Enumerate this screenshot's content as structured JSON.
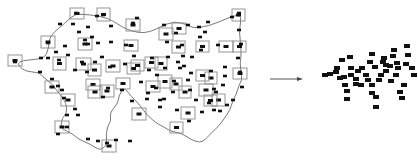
{
  "diagram": {
    "width": 418,
    "height": 163,
    "colors": {
      "box_stroke": "#8a8a8a",
      "dot_fill": "#111111",
      "curve_stroke": "#555555",
      "background": "#ffffff"
    },
    "curve_path": [
      [
        77,
        14
      ],
      [
        104,
        15
      ],
      [
        123,
        28
      ],
      [
        138,
        33
      ],
      [
        150,
        32
      ],
      [
        160,
        27
      ],
      [
        174,
        21
      ],
      [
        188,
        25
      ],
      [
        193,
        28
      ],
      [
        203,
        27
      ],
      [
        214,
        24
      ],
      [
        240,
        13
      ],
      [
        241,
        22
      ],
      [
        239,
        31
      ],
      [
        241,
        45
      ],
      [
        241,
        58
      ],
      [
        240,
        63
      ],
      [
        241,
        71
      ],
      [
        242,
        80
      ],
      [
        239,
        85
      ],
      [
        236,
        95
      ],
      [
        233,
        100
      ],
      [
        230,
        110
      ],
      [
        224,
        119
      ],
      [
        218,
        127
      ],
      [
        212,
        132
      ],
      [
        206,
        139
      ],
      [
        200,
        143
      ],
      [
        190,
        139
      ],
      [
        186,
        136
      ],
      [
        180,
        133
      ],
      [
        170,
        131
      ],
      [
        164,
        127
      ],
      [
        158,
        124
      ],
      [
        150,
        118
      ],
      [
        144,
        111
      ],
      [
        138,
        103
      ],
      [
        131,
        96
      ],
      [
        127,
        91
      ],
      [
        124,
        88
      ],
      [
        119,
        95
      ],
      [
        118,
        103
      ],
      [
        112,
        110
      ],
      [
        110,
        115
      ],
      [
        111,
        121
      ],
      [
        108,
        125
      ],
      [
        106,
        135
      ],
      [
        107,
        143
      ],
      [
        104,
        148
      ],
      [
        99,
        150
      ],
      [
        90,
        144
      ],
      [
        78,
        139
      ],
      [
        73,
        134
      ],
      [
        62,
        129
      ],
      [
        61,
        126
      ],
      [
        62,
        118
      ],
      [
        67,
        113
      ],
      [
        66,
        103
      ],
      [
        62,
        97
      ],
      [
        58,
        92
      ],
      [
        55,
        88
      ],
      [
        52,
        84
      ],
      [
        42,
        76
      ],
      [
        40,
        73
      ],
      [
        32,
        72
      ],
      [
        22,
        70
      ],
      [
        16,
        61
      ],
      [
        42,
        59
      ],
      [
        47,
        54
      ],
      [
        49,
        44
      ],
      [
        50,
        36
      ],
      [
        60,
        27
      ],
      [
        64,
        24
      ],
      [
        70,
        18
      ],
      [
        77,
        14
      ]
    ],
    "curve_boxes": [
      {
        "x": 70,
        "y": 8,
        "w": 14,
        "h": 11
      },
      {
        "x": 97,
        "y": 8,
        "w": 13,
        "h": 13
      },
      {
        "x": 126,
        "y": 19,
        "w": 14,
        "h": 12
      },
      {
        "x": 41,
        "y": 36,
        "w": 14,
        "h": 12
      },
      {
        "x": 8,
        "y": 55,
        "w": 14,
        "h": 11
      },
      {
        "x": 45,
        "y": 81,
        "w": 14,
        "h": 12
      },
      {
        "x": 61,
        "y": 94,
        "w": 14,
        "h": 12
      },
      {
        "x": 55,
        "y": 121,
        "w": 14,
        "h": 12
      },
      {
        "x": 102,
        "y": 140,
        "w": 14,
        "h": 12
      },
      {
        "x": 172,
        "y": 23,
        "w": 14,
        "h": 11
      },
      {
        "x": 159,
        "y": 28,
        "w": 14,
        "h": 12
      },
      {
        "x": 232,
        "y": 9,
        "w": 13,
        "h": 12
      },
      {
        "x": 233,
        "y": 41,
        "w": 13,
        "h": 11
      },
      {
        "x": 233,
        "y": 68,
        "w": 14,
        "h": 11
      },
      {
        "x": 158,
        "y": 75,
        "w": 14,
        "h": 13
      },
      {
        "x": 181,
        "y": 107,
        "w": 14,
        "h": 12
      },
      {
        "x": 132,
        "y": 108,
        "w": 14,
        "h": 12
      },
      {
        "x": 170,
        "y": 122,
        "w": 13,
        "h": 11
      },
      {
        "x": 212,
        "y": 94,
        "w": 13,
        "h": 12
      },
      {
        "x": 150,
        "y": 107,
        "w": 2,
        "h": 2
      }
    ],
    "free_boxes": [
      {
        "x": 78,
        "y": 38,
        "w": 14,
        "h": 12
      },
      {
        "x": 53,
        "y": 57,
        "w": 13,
        "h": 13
      },
      {
        "x": 76,
        "y": 58,
        "w": 15,
        "h": 12
      },
      {
        "x": 106,
        "y": 60,
        "w": 14,
        "h": 12
      },
      {
        "x": 124,
        "y": 40,
        "w": 14,
        "h": 11
      },
      {
        "x": 88,
        "y": 64,
        "w": 13,
        "h": 12
      },
      {
        "x": 86,
        "y": 79,
        "w": 14,
        "h": 11
      },
      {
        "x": 127,
        "y": 63,
        "w": 13,
        "h": 11
      },
      {
        "x": 116,
        "y": 78,
        "w": 14,
        "h": 11
      },
      {
        "x": 145,
        "y": 57,
        "w": 13,
        "h": 11
      },
      {
        "x": 88,
        "y": 86,
        "w": 14,
        "h": 12
      },
      {
        "x": 100,
        "y": 85,
        "w": 14,
        "h": 12
      },
      {
        "x": 146,
        "y": 81,
        "w": 14,
        "h": 11
      },
      {
        "x": 155,
        "y": 57,
        "w": 12,
        "h": 13
      },
      {
        "x": 172,
        "y": 41,
        "w": 13,
        "h": 12
      },
      {
        "x": 196,
        "y": 41,
        "w": 13,
        "h": 11
      },
      {
        "x": 205,
        "y": 72,
        "w": 12,
        "h": 12
      },
      {
        "x": 199,
        "y": 84,
        "w": 14,
        "h": 12
      },
      {
        "x": 219,
        "y": 41,
        "w": 14,
        "h": 11
      },
      {
        "x": 179,
        "y": 86,
        "w": 12,
        "h": 12
      },
      {
        "x": 196,
        "y": 70,
        "w": 13,
        "h": 11
      },
      {
        "x": 170,
        "y": 78,
        "w": 12,
        "h": 12
      },
      {
        "x": 131,
        "y": 60,
        "w": 13,
        "h": 11
      },
      {
        "x": 204,
        "y": 95,
        "w": 13,
        "h": 11
      }
    ],
    "dots": [
      [
        76,
        13
      ],
      [
        103,
        15
      ],
      [
        97,
        16
      ],
      [
        111,
        26
      ],
      [
        133,
        23
      ],
      [
        137,
        18
      ],
      [
        164,
        25
      ],
      [
        188,
        25
      ],
      [
        199,
        27
      ],
      [
        208,
        22
      ],
      [
        239,
        13
      ],
      [
        232,
        17
      ],
      [
        60,
        24
      ],
      [
        73,
        24
      ],
      [
        88,
        27
      ],
      [
        79,
        32
      ],
      [
        48,
        43
      ],
      [
        65,
        46
      ],
      [
        92,
        37
      ],
      [
        85,
        40
      ],
      [
        88,
        44
      ],
      [
        98,
        43
      ],
      [
        111,
        42
      ],
      [
        126,
        45
      ],
      [
        167,
        42
      ],
      [
        176,
        33
      ],
      [
        182,
        45
      ],
      [
        183,
        56
      ],
      [
        200,
        37
      ],
      [
        205,
        32
      ],
      [
        239,
        30
      ],
      [
        241,
        44
      ],
      [
        192,
        57
      ],
      [
        201,
        50
      ],
      [
        218,
        45
      ],
      [
        15,
        62
      ],
      [
        41,
        58
      ],
      [
        48,
        58
      ],
      [
        56,
        52
      ],
      [
        59,
        60
      ],
      [
        68,
        55
      ],
      [
        95,
        62
      ],
      [
        82,
        62
      ],
      [
        75,
        70
      ],
      [
        87,
        72
      ],
      [
        102,
        57
      ],
      [
        110,
        67
      ],
      [
        125,
        64
      ],
      [
        134,
        56
      ],
      [
        152,
        58
      ],
      [
        168,
        57
      ],
      [
        178,
        62
      ],
      [
        149,
        70
      ],
      [
        157,
        75
      ],
      [
        165,
        68
      ],
      [
        191,
        73
      ],
      [
        180,
        68
      ],
      [
        188,
        80
      ],
      [
        211,
        71
      ],
      [
        225,
        67
      ],
      [
        238,
        58
      ],
      [
        240,
        72
      ],
      [
        242,
        87
      ],
      [
        225,
        76
      ],
      [
        223,
        85
      ],
      [
        214,
        89
      ],
      [
        233,
        100
      ],
      [
        220,
        111
      ],
      [
        58,
        86
      ],
      [
        52,
        79
      ],
      [
        40,
        72
      ],
      [
        62,
        90
      ],
      [
        64,
        98
      ],
      [
        67,
        115
      ],
      [
        75,
        109
      ],
      [
        78,
        115
      ],
      [
        67,
        127
      ],
      [
        58,
        134
      ],
      [
        88,
        139
      ],
      [
        98,
        141
      ],
      [
        107,
        143
      ],
      [
        116,
        140
      ],
      [
        130,
        141
      ],
      [
        148,
        93
      ],
      [
        156,
        88
      ],
      [
        147,
        99
      ],
      [
        160,
        100
      ],
      [
        164,
        99
      ],
      [
        160,
        107
      ],
      [
        177,
        110
      ],
      [
        189,
        121
      ],
      [
        202,
        112
      ],
      [
        214,
        110
      ],
      [
        227,
        105
      ],
      [
        132,
        101
      ],
      [
        141,
        82
      ],
      [
        122,
        90
      ],
      [
        108,
        88
      ],
      [
        103,
        97
      ],
      [
        173,
        92
      ],
      [
        174,
        81
      ],
      [
        184,
        66
      ],
      [
        190,
        90
      ],
      [
        209,
        103
      ],
      [
        216,
        92
      ],
      [
        196,
        100
      ]
    ],
    "arrow": {
      "x1": 270,
      "y1": 79,
      "x2": 303,
      "y2": 79
    },
    "cluster_dots": [
      [
        342,
        60
      ],
      [
        350,
        57
      ],
      [
        372,
        54
      ],
      [
        383,
        62
      ],
      [
        393,
        56
      ],
      [
        394,
        50
      ],
      [
        407,
        46
      ],
      [
        408,
        55
      ],
      [
        375,
        67
      ],
      [
        386,
        71
      ],
      [
        358,
        71
      ],
      [
        337,
        68
      ],
      [
        351,
        68
      ],
      [
        362,
        68
      ],
      [
        370,
        62
      ],
      [
        386,
        65
      ],
      [
        397,
        63
      ],
      [
        406,
        64
      ],
      [
        414,
        75
      ],
      [
        396,
        75
      ],
      [
        381,
        75
      ],
      [
        366,
        75
      ],
      [
        351,
        75
      ],
      [
        336,
        72
      ],
      [
        325,
        75
      ],
      [
        340,
        78
      ],
      [
        356,
        79
      ],
      [
        368,
        80
      ],
      [
        379,
        80
      ],
      [
        361,
        85
      ],
      [
        372,
        85
      ],
      [
        391,
        81
      ],
      [
        404,
        85
      ],
      [
        345,
        85
      ],
      [
        347,
        91
      ],
      [
        372,
        93
      ],
      [
        376,
        97
      ],
      [
        400,
        92
      ],
      [
        402,
        98
      ],
      [
        347,
        99
      ],
      [
        376,
        107
      ],
      [
        412,
        68
      ],
      [
        398,
        68
      ],
      [
        384,
        58
      ],
      [
        390,
        66
      ],
      [
        344,
        77
      ],
      [
        356,
        84
      ],
      [
        330,
        74
      ]
    ]
  }
}
